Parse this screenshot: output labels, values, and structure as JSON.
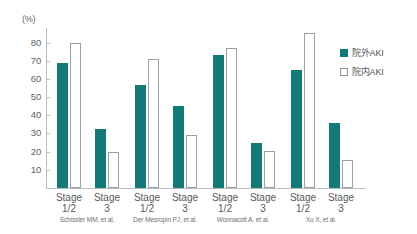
{
  "chart_data": {
    "type": "bar",
    "title": "",
    "xlabel": "",
    "ylabel": "(%)",
    "ylim": [
      0,
      88
    ],
    "y_ticks": [
      10,
      20,
      30,
      40,
      50,
      60,
      70,
      80
    ],
    "grid": false,
    "legend_position": "right",
    "categories": [
      "Stage 1/2",
      "Stage 3",
      "Stage 1/2",
      "Stage 3",
      "Stage 1/2",
      "Stage 3",
      "Stage 1/2",
      "Stage 3"
    ],
    "series": [
      {
        "name": "院外AKI",
        "color": "#147a77",
        "values": [
          69,
          32.5,
          56.5,
          45,
          73,
          25,
          65,
          36
        ]
      },
      {
        "name": "院内AKI",
        "color": "#ffffff",
        "values": [
          80,
          20,
          71,
          29,
          77,
          20.5,
          85,
          15.5
        ]
      }
    ],
    "groups": [
      {
        "study": "Schissler MM,  et al.",
        "categories": [
          {
            "label_line1": "Stage",
            "label_line2": "1/2",
            "out": 69,
            "in": 80
          },
          {
            "label_line1": "Stage",
            "label_line2": "3",
            "out": 32.5,
            "in": 20
          }
        ]
      },
      {
        "study": "Der Mesropin PJ,  et al.",
        "categories": [
          {
            "label_line1": "Stage",
            "label_line2": "1/2",
            "out": 56.5,
            "in": 71
          },
          {
            "label_line1": "Stage",
            "label_line2": "3",
            "out": 45,
            "in": 29
          }
        ]
      },
      {
        "study": "Wonnacott A,  et al.",
        "categories": [
          {
            "label_line1": "Stage",
            "label_line2": "1/2",
            "out": 73,
            "in": 77
          },
          {
            "label_line1": "Stage",
            "label_line2": "3",
            "out": 25,
            "in": 20.5
          }
        ]
      },
      {
        "study": "Xu X,  et al.",
        "categories": [
          {
            "label_line1": "Stage",
            "label_line2": "1/2",
            "out": 65,
            "in": 85
          },
          {
            "label_line1": "Stage",
            "label_line2": "3",
            "out": 36,
            "in": 15.5
          }
        ]
      }
    ]
  },
  "axis": {
    "unit": "(%)",
    "ticks": [
      "80",
      "70",
      "60",
      "50",
      "40",
      "30",
      "20",
      "10"
    ]
  },
  "legend": {
    "items": [
      {
        "label": "院外AKI",
        "style": "filled"
      },
      {
        "label": "院内AKI",
        "style": "outline"
      }
    ]
  },
  "colors": {
    "bar_filled": "#147a77",
    "bar_outline_stroke": "#9aa0a3",
    "axis": "#b9bdbf",
    "text": "#55595c",
    "background": "#ffffff"
  }
}
